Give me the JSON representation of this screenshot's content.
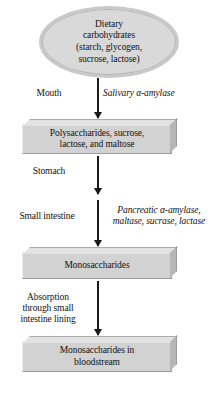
{
  "diagram": {
    "type": "flowchart",
    "orientation": "vertical",
    "colors": {
      "node_fill": "#d2d2d2",
      "ellipse_fill": "#d9d9d9",
      "bevel_light": "#e2e2e2",
      "bevel_dark": "#b6b6b6",
      "arrow": "#1a1a1a",
      "text": "#111111",
      "background": "#ffffff"
    },
    "nodes": [
      {
        "id": "dietary-carbohydrates",
        "shape": "ellipse",
        "text": "Dietary\ncarbohydrates\n(starch, glycogen,\nsucrose, lactose)"
      },
      {
        "id": "polysaccharides",
        "shape": "box-3d",
        "text": "Polysaccharides, sucrose,\nlactose, and maltose"
      },
      {
        "id": "monosaccharides",
        "shape": "box-3d",
        "text": "Monosaccharides"
      },
      {
        "id": "monosaccharides-bloodstream",
        "shape": "box-3d",
        "text": "Monosaccharides in\nbloodstream"
      }
    ],
    "edges": [
      {
        "id": "edge-1",
        "from": "dietary-carbohydrates",
        "to": "polysaccharides",
        "stage_label": "Mouth",
        "enzyme_label": "Salivary α-amylase"
      },
      {
        "id": "edge-2",
        "from": "polysaccharides",
        "to": "small-intestine-step",
        "stage_label": "Stomach",
        "enzyme_label": ""
      },
      {
        "id": "edge-3",
        "from": "small-intestine-step",
        "to": "monosaccharides",
        "stage_label": "Small intestine",
        "enzyme_label": "Pancreatic α-amylase,\nmaltase, sucrase, lactase"
      },
      {
        "id": "edge-4",
        "from": "monosaccharides",
        "to": "monosaccharides-bloodstream",
        "stage_label": "Absorption\nthrough small\nintestine lining",
        "enzyme_label": ""
      }
    ]
  }
}
